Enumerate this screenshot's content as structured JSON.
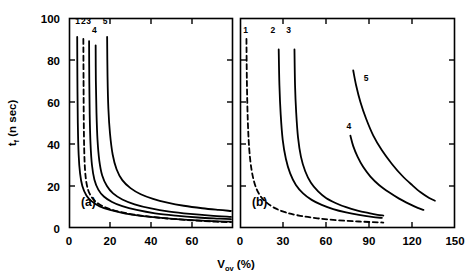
{
  "figure": {
    "background": "#ffffff",
    "ink_color": "#000000",
    "width": 472,
    "height": 277
  },
  "axis_titles": {
    "y_main": "t",
    "y_sub": "f",
    "y_unit": " (n sec)",
    "y_full": "t f (n sec)",
    "x_main": "V",
    "x_sub": "ov",
    "x_unit": " (%)",
    "x_full": "V ov (%)"
  },
  "panels": [
    {
      "id": "a",
      "label": "(a)",
      "xlim": [
        0,
        80
      ],
      "ylim": [
        0,
        100
      ],
      "xticks": [
        0,
        20,
        40,
        60,
        80
      ],
      "xticklabels": [
        "0",
        "20",
        "40",
        "60",
        ""
      ],
      "yticks": [
        0,
        20,
        40,
        60,
        80,
        100
      ],
      "yticklabels": [
        "0",
        "20",
        "40",
        "60",
        "80",
        "100"
      ],
      "show_y_labels": true,
      "curve_labels": [
        {
          "text": "1",
          "x": 4.2,
          "y": 97
        },
        {
          "text": "2",
          "x": 7.0,
          "y": 97
        },
        {
          "text": "3",
          "x": 9.6,
          "y": 97
        },
        {
          "text": "4",
          "x": 12.4,
          "y": 93
        },
        {
          "text": "5",
          "x": 17.6,
          "y": 97
        }
      ]
    },
    {
      "id": "b",
      "label": "(b)",
      "xlim": [
        0,
        150
      ],
      "ylim": [
        0,
        100
      ],
      "xticks": [
        0,
        30,
        60,
        90,
        120,
        150
      ],
      "xticklabels": [
        "0",
        "30",
        "60",
        "90",
        "120",
        "150"
      ],
      "yticks": [
        0,
        20,
        40,
        60,
        80,
        100
      ],
      "yticklabels": [
        "",
        "",
        "",
        "",
        "",
        ""
      ],
      "show_y_labels": false,
      "curve_labels": [
        {
          "text": "1",
          "x": 4,
          "y": 93
        },
        {
          "text": "2",
          "x": 23,
          "y": 93
        },
        {
          "text": "3",
          "x": 34,
          "y": 93
        },
        {
          "text": "5",
          "x": 88,
          "y": 70
        },
        {
          "text": "4",
          "x": 76,
          "y": 47
        }
      ]
    }
  ],
  "chart_data": {
    "type": "line",
    "title": "",
    "xlabel": "V_ov (%)",
    "ylabel": "t_f (n sec)",
    "grid": false,
    "legend": "inline curve numbers",
    "subplots": [
      {
        "panel": "a",
        "xlim": [
          0,
          80
        ],
        "ylim": [
          0,
          100
        ],
        "series": [
          {
            "name": "1",
            "style": "solid",
            "points": [
              [
                4.0,
                91
              ],
              [
                4.1,
                70
              ],
              [
                4.3,
                50
              ],
              [
                4.7,
                35
              ],
              [
                5.4,
                26
              ],
              [
                6.5,
                20
              ],
              [
                8.5,
                15.5
              ],
              [
                11,
                12.8
              ],
              [
                15,
                10.3
              ],
              [
                20,
                8.6
              ],
              [
                27,
                7.0
              ],
              [
                35,
                5.8
              ],
              [
                45,
                4.8
              ],
              [
                58,
                3.9
              ],
              [
                70,
                3.3
              ],
              [
                79,
                3.0
              ]
            ]
          },
          {
            "name": "2",
            "style": "dashed",
            "points": [
              [
                7.0,
                90
              ],
              [
                7.1,
                70
              ],
              [
                7.2,
                52
              ],
              [
                7.4,
                38
              ],
              [
                7.8,
                28
              ],
              [
                8.6,
                21
              ],
              [
                10,
                16.5
              ],
              [
                12.5,
                13.0
              ],
              [
                16,
                10.6
              ],
              [
                21,
                8.7
              ],
              [
                28,
                7.0
              ],
              [
                36,
                5.8
              ],
              [
                46,
                4.7
              ],
              [
                58,
                3.8
              ],
              [
                70,
                3.1
              ],
              [
                79,
                2.8
              ]
            ]
          },
          {
            "name": "3",
            "style": "solid",
            "points": [
              [
                9.8,
                89
              ],
              [
                9.9,
                70
              ],
              [
                10.1,
                54
              ],
              [
                10.5,
                40
              ],
              [
                11.2,
                30
              ],
              [
                12.4,
                23
              ],
              [
                14.3,
                18.3
              ],
              [
                17,
                15.0
              ],
              [
                21,
                12.4
              ],
              [
                26,
                10.4
              ],
              [
                33,
                8.6
              ],
              [
                42,
                7.0
              ],
              [
                52,
                5.9
              ],
              [
                63,
                5.0
              ],
              [
                72,
                4.5
              ],
              [
                79,
                4.2
              ]
            ]
          },
          {
            "name": "4",
            "style": "solid",
            "points": [
              [
                13.0,
                87
              ],
              [
                13.1,
                70
              ],
              [
                13.4,
                55
              ],
              [
                13.9,
                42
              ],
              [
                14.8,
                32
              ],
              [
                16.2,
                25
              ],
              [
                18.5,
                20.0
              ],
              [
                21.5,
                16.5
              ],
              [
                26,
                13.6
              ],
              [
                32,
                11.3
              ],
              [
                40,
                9.3
              ],
              [
                49,
                7.8
              ],
              [
                59,
                6.7
              ],
              [
                69,
                5.9
              ],
              [
                79,
                5.3
              ]
            ]
          },
          {
            "name": "5",
            "style": "solid",
            "points": [
              [
                18.6,
                91
              ],
              [
                18.8,
                72
              ],
              [
                19.2,
                57
              ],
              [
                20.0,
                45
              ],
              [
                21.3,
                35
              ],
              [
                23.2,
                28
              ],
              [
                26,
                22.8
              ],
              [
                30,
                19.0
              ],
              [
                35,
                16.1
              ],
              [
                41,
                13.9
              ],
              [
                48,
                12.1
              ],
              [
                56,
                10.6
              ],
              [
                65,
                9.4
              ],
              [
                73,
                8.6
              ],
              [
                79,
                8.1
              ]
            ]
          }
        ]
      },
      {
        "panel": "b",
        "xlim": [
          0,
          150
        ],
        "ylim": [
          0,
          100
        ],
        "series": [
          {
            "name": "1",
            "style": "dashed",
            "points": [
              [
                4.5,
                90
              ],
              [
                4.8,
                70
              ],
              [
                5.4,
                52
              ],
              [
                6.4,
                38
              ],
              [
                8.0,
                28
              ],
              [
                10.3,
                21
              ],
              [
                13.5,
                16.0
              ],
              [
                18,
                12.4
              ],
              [
                24,
                9.6
              ],
              [
                32,
                7.4
              ],
              [
                42,
                5.8
              ],
              [
                54,
                4.6
              ],
              [
                68,
                3.7
              ],
              [
                83,
                3.1
              ],
              [
                96,
                2.7
              ],
              [
                100,
                2.6
              ]
            ]
          },
          {
            "name": "2",
            "style": "solid",
            "points": [
              [
                27,
                85
              ],
              [
                27.5,
                68
              ],
              [
                28.4,
                54
              ],
              [
                29.8,
                42
              ],
              [
                32,
                33
              ],
              [
                35,
                26
              ],
              [
                39,
                20.5
              ],
              [
                44,
                16.5
              ],
              [
                50,
                13.4
              ],
              [
                57,
                11.0
              ],
              [
                65,
                9.0
              ],
              [
                74,
                7.4
              ],
              [
                83,
                6.2
              ],
              [
                92,
                5.3
              ],
              [
                99,
                4.8
              ]
            ]
          },
          {
            "name": "3",
            "style": "solid",
            "points": [
              [
                38,
                85
              ],
              [
                38.4,
                68
              ],
              [
                39.2,
                55
              ],
              [
                40.5,
                43
              ],
              [
                42.5,
                34
              ],
              [
                45.5,
                27
              ],
              [
                49.5,
                21.5
              ],
              [
                54.5,
                17.4
              ],
              [
                60,
                14.3
              ],
              [
                67,
                11.8
              ],
              [
                74,
                9.9
              ],
              [
                82,
                8.3
              ],
              [
                90,
                7.1
              ],
              [
                96,
                6.3
              ],
              [
                100,
                5.9
              ]
            ]
          },
          {
            "name": "4",
            "style": "solid",
            "points": [
              [
                77,
                44
              ],
              [
                79,
                39
              ],
              [
                82,
                34
              ],
              [
                86,
                29
              ],
              [
                91,
                24.5
              ],
              [
                97,
                20.5
              ],
              [
                104,
                17.0
              ],
              [
                111,
                14.0
              ],
              [
                118,
                11.5
              ],
              [
                124,
                9.6
              ],
              [
                128,
                8.6
              ]
            ]
          },
          {
            "name": "5",
            "style": "solid",
            "points": [
              [
                79,
                75
              ],
              [
                81,
                68
              ],
              [
                84,
                60
              ],
              [
                88,
                52
              ],
              [
                93,
                44
              ],
              [
                99,
                37
              ],
              [
                106,
                30.5
              ],
              [
                113,
                25.0
              ],
              [
                120,
                20.5
              ],
              [
                126,
                17.0
              ],
              [
                132,
                14.3
              ],
              [
                136,
                13.0
              ]
            ]
          }
        ]
      }
    ]
  }
}
